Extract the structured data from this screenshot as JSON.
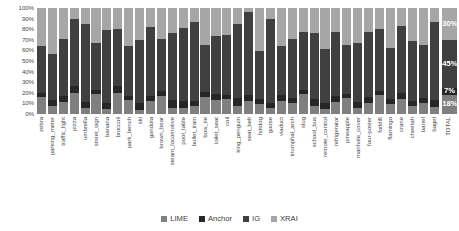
{
  "chart_data": {
    "type": "bar",
    "subtype": "stacked-percentage-column",
    "title": "",
    "xlabel": "",
    "ylabel": "",
    "ylim": [
      0,
      100
    ],
    "ytick_labels": [
      "100%",
      "90%",
      "80%",
      "70%",
      "60%",
      "50%",
      "40%",
      "30%",
      "20%",
      "10%",
      "0%"
    ],
    "ytick_values": [
      100,
      90,
      80,
      70,
      60,
      50,
      40,
      30,
      20,
      10,
      0
    ],
    "grid": false,
    "legend_position": "bottom",
    "stack_order_bottom_to_top": [
      "LIME",
      "Anchor",
      "IG",
      "XRAI"
    ],
    "categories": [
      "zebra",
      "parking_meter",
      "traffic_light",
      "pizza",
      "umbrella",
      "street_sign",
      "banana",
      "broccoli",
      "park_bench",
      "ski",
      "gondola",
      "brown_bear",
      "steam_locomotive",
      "pool_table",
      "bullet_train",
      "bow_tie",
      "toilet_seat",
      "coil",
      "king_penguin",
      "seat_belt",
      "hotdog",
      "goose",
      "viaduct",
      "triumphal_arch",
      "slug",
      "school_bus",
      "remote_control",
      "refrigerator",
      "pineapple",
      "manhole_cover",
      "four-poster",
      "forklift",
      "flamingo",
      "crane",
      "cheetah",
      "barrel",
      "bagel",
      "TOTAL"
    ],
    "series": [
      {
        "name": "LIME",
        "color": "#7f7f7f",
        "values": [
          16,
          8,
          11,
          20,
          6,
          19,
          5,
          20,
          13,
          4,
          12,
          17,
          6,
          6,
          8,
          16,
          13,
          14,
          8,
          12,
          9,
          6,
          12,
          10,
          19,
          8,
          5,
          11,
          15,
          6,
          10,
          18,
          9,
          14,
          8,
          10,
          7,
          18
        ]
      },
      {
        "name": "Anchor",
        "color": "#262626",
        "values": [
          4,
          5,
          6,
          6,
          5,
          4,
          5,
          6,
          4,
          6,
          5,
          5,
          7,
          6,
          4,
          5,
          6,
          4,
          7,
          6,
          5,
          4,
          6,
          5,
          4,
          6,
          5,
          6,
          4,
          5,
          6,
          4,
          5,
          6,
          4,
          5,
          6,
          7
        ]
      },
      {
        "name": "IG",
        "color": "#404040",
        "values": [
          44,
          44,
          54,
          64,
          74,
          44,
          69,
          54,
          47,
          60,
          65,
          49,
          63,
          69,
          75,
          44,
          55,
          57,
          70,
          78,
          45,
          80,
          46,
          56,
          54,
          62,
          51,
          60,
          46,
          56,
          61,
          58,
          48,
          63,
          57,
          50,
          74,
          45
        ]
      },
      {
        "name": "XRAI",
        "color": "#a6a6a6",
        "values": [
          36,
          43,
          29,
          10,
          15,
          33,
          21,
          20,
          36,
          30,
          18,
          29,
          24,
          19,
          13,
          35,
          26,
          25,
          15,
          4,
          41,
          10,
          36,
          29,
          23,
          24,
          39,
          23,
          35,
          33,
          23,
          20,
          38,
          17,
          31,
          35,
          13,
          30
        ]
      }
    ],
    "total_bar": {
      "label": "TOTAL",
      "segments": [
        {
          "name": "XRAI",
          "value": 30,
          "label": "30%"
        },
        {
          "name": "IG",
          "value": 45,
          "label": "45%"
        },
        {
          "name": "Anchor",
          "value": 7,
          "label": "7%"
        },
        {
          "name": "LIME",
          "value": 18,
          "label": "18%"
        }
      ]
    },
    "legend": [
      {
        "label": "LIME",
        "color": "#7f7f7f"
      },
      {
        "label": "Anchor",
        "color": "#262626"
      },
      {
        "label": "IG",
        "color": "#404040"
      },
      {
        "label": "XRAI",
        "color": "#a6a6a6"
      }
    ]
  }
}
